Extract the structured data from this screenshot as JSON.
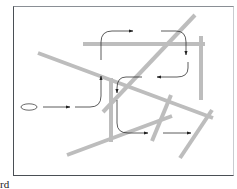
{
  "diagram": {
    "colors": {
      "obstacle": "#bdbdbd",
      "path": "#333333",
      "border": "#4a4f55"
    },
    "caption": "rd",
    "obstacles": [
      [
        83,
        44,
        205,
        44
      ],
      [
        201,
        36,
        201,
        100
      ],
      [
        195,
        15,
        103,
        112
      ],
      [
        38,
        53,
        213,
        118
      ],
      [
        111,
        78,
        111,
        142
      ],
      [
        67,
        155,
        172,
        116
      ],
      [
        152,
        141,
        171,
        95
      ],
      [
        180,
        158,
        212,
        110
      ]
    ],
    "path_segments": [
      {
        "d": "M43,107 L70,107",
        "arrow": true
      },
      {
        "d": "M75,107 L90,107 Q101,107 101,96 L101,76",
        "arrow": true
      },
      {
        "d": "M101,60 L101,42 Q101,31 112,31 L133,31",
        "arrow": true
      },
      {
        "d": "M161,31 L176,31 Q186,31 186,42 L186,55",
        "arrow": true
      },
      {
        "d": "M188,62 L188,68 Q188,77 177,77 L157,77",
        "arrow": true
      },
      {
        "d": "M142,77 L126,77 Q117,77 117,88 L117,93",
        "arrow": true
      },
      {
        "d": "M117,100 L117,123 Q117,133 128,133 L148,133",
        "arrow": true
      },
      {
        "d": "M163,133 L191,133",
        "arrow": true
      }
    ],
    "start_node": {
      "label": ""
    }
  }
}
